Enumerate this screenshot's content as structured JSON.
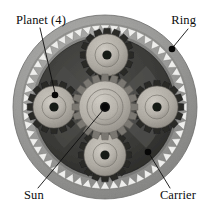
{
  "figure": {
    "type": "labeled-photograph",
    "background_color": "#ffffff",
    "image_width": 212,
    "image_height": 214
  },
  "labels": {
    "planet": "Planet (4)",
    "ring": "Ring",
    "sun": "Sun",
    "carrier": "Carrier"
  },
  "parts": {
    "ring_gear": {
      "name": "Ring",
      "description": "Outer internally-toothed annulus disc",
      "center_x": 105,
      "center_y": 107,
      "outer_radius": 92,
      "tooth_tip_radius": 74,
      "tooth_root_radius": 82,
      "tooth_count": 56,
      "body_color": "#9b9b9b",
      "tooth_color": "#f2f2f0"
    },
    "sun_gear": {
      "name": "Sun",
      "description": "Central gear with raised hub and bore",
      "center_x": 105,
      "center_y": 107,
      "tip_radius": 33,
      "root_radius": 26,
      "hub_radius": 18,
      "bore_radius": 5,
      "tooth_count": 20,
      "body_color": "#b9b5ad",
      "tooth_color": "#7d7a74"
    },
    "planet_gears": {
      "name": "Planet (4)",
      "count": 4,
      "tip_radius": 27,
      "root_radius": 21,
      "hub_radius": 12,
      "bore_radius": 4.6,
      "tooth_count": 16,
      "body_color": "#b2aea6",
      "tooth_color": "#2a2a28",
      "positions": [
        {
          "id": "planet-top",
          "center_x": 107,
          "center_y": 55
        },
        {
          "id": "planet-left",
          "center_x": 54,
          "center_y": 107
        },
        {
          "id": "planet-right",
          "center_x": 157,
          "center_y": 107
        },
        {
          "id": "planet-bottom",
          "center_x": 105,
          "center_y": 155
        }
      ]
    },
    "carrier": {
      "name": "Carrier",
      "description": "Dark shadowed plate spanning between planet gears",
      "color": "#3a3a38"
    }
  },
  "callouts": [
    {
      "id": "callout-planet",
      "label": "Planet (4)",
      "text_x": 16,
      "text_y": 24,
      "anchor": "start",
      "line": {
        "x1": 40,
        "y1": 28,
        "x2": 55,
        "y2": 93
      },
      "dot": {
        "cx": 55,
        "cy": 95,
        "r": 3.3
      }
    },
    {
      "id": "callout-ring",
      "label": "Ring",
      "text_x": 196,
      "text_y": 24,
      "anchor": "end",
      "line": {
        "x1": 188,
        "y1": 29,
        "x2": 174,
        "y2": 46
      },
      "dot": {
        "cx": 172,
        "cy": 49,
        "r": 3.3
      }
    },
    {
      "id": "callout-sun",
      "label": "Sun",
      "text_x": 24,
      "text_y": 199,
      "anchor": "start",
      "line": {
        "x1": 38,
        "y1": 188,
        "x2": 103,
        "y2": 110
      },
      "dot": {
        "cx": 105,
        "cy": 107,
        "r": 3.6
      }
    },
    {
      "id": "callout-carrier",
      "label": "Carrier",
      "text_x": 196,
      "text_y": 199,
      "anchor": "end",
      "line": {
        "x1": 170,
        "y1": 188,
        "x2": 150,
        "y2": 155
      },
      "dot": {
        "cx": 148,
        "cy": 152,
        "r": 3.3
      }
    }
  ],
  "colors": {
    "background": "#ffffff",
    "ring_body": "#9b9b9b",
    "ring_teeth": "#f2f2f0",
    "carrier_dark": "#3a3a38",
    "gear_metal": "#b5b1a9",
    "line_ink": "#0d0d0d"
  }
}
